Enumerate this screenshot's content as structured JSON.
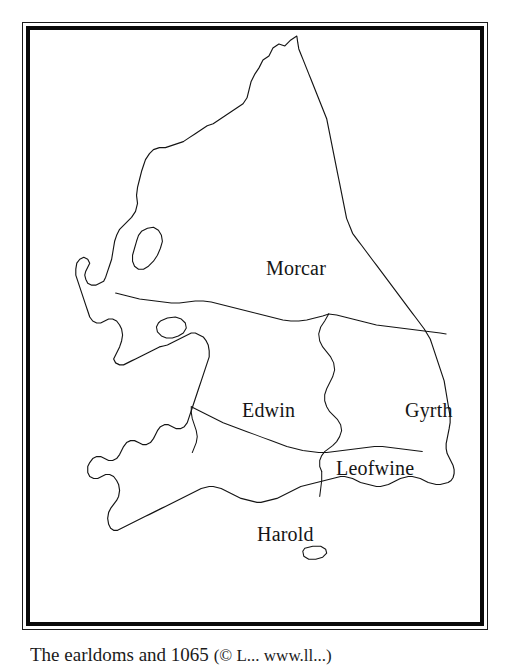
{
  "figure": {
    "kind": "historical-map",
    "frame_style": "double-rule-border",
    "background_color": "#ffffff",
    "ink_color": "#141414"
  },
  "map": {
    "region_labels": [
      {
        "id": "morcar",
        "label": "Morcar"
      },
      {
        "id": "edwin",
        "label": "Edwin"
      },
      {
        "id": "gyrth",
        "label": "Gyrth"
      },
      {
        "id": "leofwine",
        "label": "Leofwine"
      },
      {
        "id": "harold",
        "label": "Harold"
      }
    ]
  },
  "caption": {
    "main": "The earldoms and 1065",
    "credit": "(© L...  www.ll...)",
    "note": "caption is cropped by the bottom edge of the page"
  }
}
